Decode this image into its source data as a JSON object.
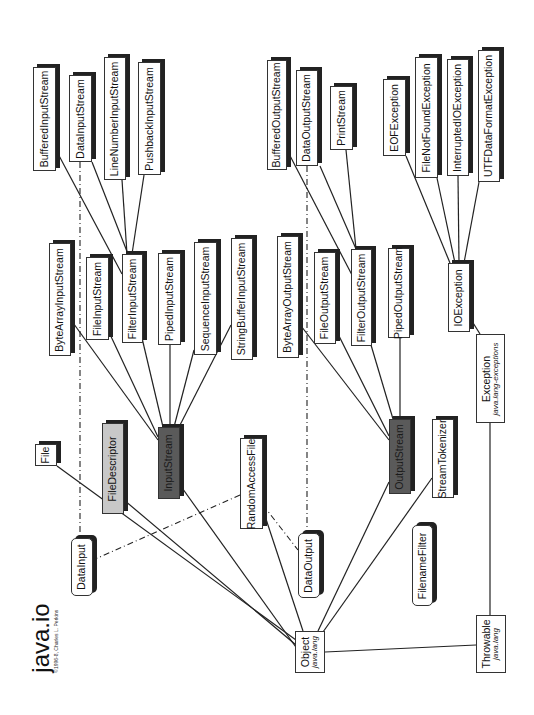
{
  "title": {
    "text": "java.io",
    "copyright": "©1996-8, Charles L. Perkins"
  },
  "nodes": {
    "buffered_input_stream": {
      "label": "BufferedInputStream",
      "kind": "class"
    },
    "data_input_stream": {
      "label": "DataInputStream",
      "kind": "class"
    },
    "line_number_input_stream": {
      "label": "LineNumberInputStream",
      "kind": "class"
    },
    "pushback_input_stream": {
      "label": "PushbackInputStream",
      "kind": "class"
    },
    "buffered_output_stream": {
      "label": "BufferedOutputStream",
      "kind": "class"
    },
    "data_output_stream": {
      "label": "DataOutputStream",
      "kind": "class"
    },
    "print_stream": {
      "label": "PrintStream",
      "kind": "class"
    },
    "eof_exception": {
      "label": "EOFException",
      "kind": "class"
    },
    "file_not_found_exception": {
      "label": "FileNotFoundException",
      "kind": "class"
    },
    "interrupted_io_exception": {
      "label": "InterruptedIOException",
      "kind": "class"
    },
    "utf_data_format_exception": {
      "label": "UTFDataFormatException",
      "kind": "class"
    },
    "byte_array_input_stream": {
      "label": "ByteArrayInputStream",
      "kind": "class"
    },
    "file_input_stream": {
      "label": "FileInputStream",
      "kind": "class"
    },
    "filter_input_stream": {
      "label": "FilterInputStream",
      "kind": "class"
    },
    "piped_input_stream": {
      "label": "PipedInputStream",
      "kind": "class"
    },
    "sequence_input_stream": {
      "label": "SequenceInputStream",
      "kind": "class"
    },
    "string_buffer_input_stream": {
      "label": "StringBufferInputStream",
      "kind": "class"
    },
    "byte_array_output_stream": {
      "label": "ByteArrayOutputStream",
      "kind": "class"
    },
    "file_output_stream": {
      "label": "FileOutputStream",
      "kind": "class"
    },
    "filter_output_stream": {
      "label": "FilterOutputStream",
      "kind": "class"
    },
    "piped_output_stream": {
      "label": "PipedOutputStream",
      "kind": "class"
    },
    "io_exception": {
      "label": "IOException",
      "kind": "class"
    },
    "exception": {
      "label": "Exception",
      "sub": "java.lang-exceptions",
      "kind": "external"
    },
    "file": {
      "label": "File",
      "kind": "class"
    },
    "file_descriptor": {
      "label": "FileDescriptor",
      "kind": "final"
    },
    "input_stream": {
      "label": "InputStream",
      "kind": "abstract"
    },
    "random_access_file": {
      "label": "RandomAccessFile",
      "kind": "class"
    },
    "data_input": {
      "label": "DataInput",
      "kind": "interface"
    },
    "data_output": {
      "label": "DataOutput",
      "kind": "interface"
    },
    "output_stream": {
      "label": "OutputStream",
      "kind": "abstract"
    },
    "stream_tokenizer": {
      "label": "StreamTokenizer",
      "kind": "class"
    },
    "filename_filter": {
      "label": "FilenameFilter",
      "kind": "interface"
    },
    "object": {
      "label": "Object",
      "sub": "java.lang",
      "kind": "external"
    },
    "throwable": {
      "label": "Throwable",
      "sub": "java.lang",
      "kind": "external"
    }
  },
  "legend": {
    "abstract_fill": "#5a5a5a",
    "final_fill": "#c8c8c8",
    "class_fill": "#ffffff",
    "line_color": "#222222"
  }
}
